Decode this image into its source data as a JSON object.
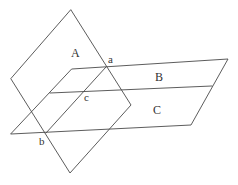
{
  "diagram": {
    "type": "intersecting-planes",
    "background": "#ffffff",
    "stroke_color": "#4a4a4a",
    "text_color": "#333333",
    "plane_A": {
      "label": "A",
      "vertices": [
        [
          71,
          10
        ],
        [
          131,
          105
        ],
        [
          70,
          173
        ],
        [
          11,
          79
        ]
      ],
      "label_pos": [
        71,
        57
      ]
    },
    "plane_BC": {
      "outline": [
        [
          72,
          69
        ],
        [
          228,
          59
        ],
        [
          191,
          125
        ],
        [
          11,
          134
        ]
      ],
      "divider": [
        [
          50,
          93
        ],
        [
          212,
          86
        ]
      ],
      "label_B": "B",
      "label_B_pos": [
        155,
        81
      ],
      "label_C": "C",
      "label_C_pos": [
        153,
        114
      ]
    },
    "intersection_line": [
      [
        106,
        67
      ],
      [
        46,
        133
      ]
    ],
    "points": [
      {
        "id": "a",
        "label": "a",
        "pos": [
          106,
          67
        ],
        "label_pos": [
          108,
          63
        ]
      },
      {
        "id": "c",
        "label": "c",
        "pos": [
          85,
          91
        ],
        "label_pos": [
          84,
          101
        ]
      },
      {
        "id": "b",
        "label": "b",
        "pos": [
          46,
          133
        ],
        "label_pos": [
          39,
          145
        ]
      }
    ]
  }
}
